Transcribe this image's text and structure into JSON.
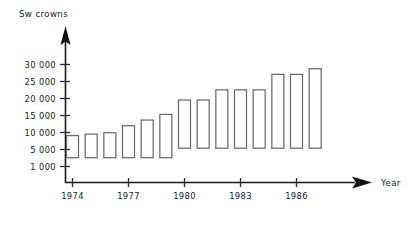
{
  "chart_data": {
    "type": "bar",
    "title": "",
    "ylabel": "Sw crowns",
    "xlabel": "Year",
    "grid": false,
    "legend": false,
    "bar_style": "floating-range-bar-outline",
    "ylim": [
      0,
      32000
    ],
    "ytick_labels": [
      "30 000",
      "25 000",
      "20 000",
      "15 000",
      "10 000",
      "5 000",
      "1 000"
    ],
    "ytick_values": [
      30000,
      25000,
      20000,
      15000,
      10000,
      5000,
      1000
    ],
    "xtick_labels": [
      "1974",
      "1977",
      "1980",
      "1983",
      "1986"
    ],
    "xtick_values": [
      1974,
      1977,
      1980,
      1983,
      1986
    ],
    "categories": [
      "1974",
      "1975",
      "1976",
      "1977",
      "1978",
      "1979",
      "1980",
      "1981",
      "1982",
      "1983",
      "1984",
      "1985",
      "1986",
      "1987"
    ],
    "series": [
      {
        "name": "Range",
        "low": [
          3500,
          3500,
          3500,
          3500,
          3500,
          3500,
          6200,
          6200,
          6200,
          6200,
          6200,
          6200,
          6200,
          6200
        ],
        "high": [
          9800,
          10200,
          10600,
          12600,
          14200,
          15800,
          19900,
          19900,
          22800,
          22800,
          22800,
          27200,
          27200,
          28800
        ]
      }
    ]
  }
}
